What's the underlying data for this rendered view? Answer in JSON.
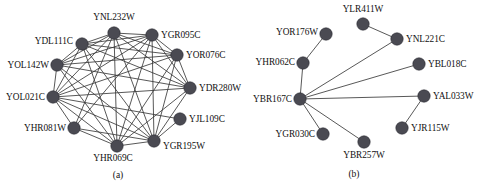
{
  "figure": {
    "width": 477,
    "height": 191,
    "node_color": "#4a4a52",
    "edge_color": "#3a3a3a",
    "background_color": "#ffffff"
  },
  "panels": [
    {
      "id": "a",
      "caption": "(a)",
      "caption_x": 118,
      "caption_y": 170,
      "node_radius": 6.2,
      "nodes": [
        {
          "id": "YNL232W",
          "label": "YNL232W",
          "x": 114,
          "y": 33,
          "label_pos": "above",
          "lx": 114,
          "ly": 22
        },
        {
          "id": "YGR095C",
          "label": "YGR095C",
          "x": 152,
          "y": 35,
          "label_pos": "right",
          "lx": 161,
          "ly": 35
        },
        {
          "id": "YDL111C",
          "label": "YDL111C",
          "x": 82,
          "y": 44,
          "label_pos": "left",
          "lx": 73,
          "ly": 41
        },
        {
          "id": "YOR076C",
          "label": "YOR076C",
          "x": 177,
          "y": 55,
          "label_pos": "right",
          "lx": 186,
          "ly": 55
        },
        {
          "id": "YOL142W",
          "label": "YOL142W",
          "x": 57,
          "y": 65,
          "label_pos": "left",
          "lx": 49,
          "ly": 65
        },
        {
          "id": "YDR280W",
          "label": "YDR280W",
          "x": 190,
          "y": 88,
          "label_pos": "right",
          "lx": 199,
          "ly": 88
        },
        {
          "id": "YOL021C",
          "label": "YOL021C",
          "x": 53,
          "y": 97,
          "label_pos": "left",
          "lx": 45,
          "ly": 97
        },
        {
          "id": "YJL109C",
          "label": "YJL109C",
          "x": 180,
          "y": 119,
          "label_pos": "right",
          "lx": 189,
          "ly": 119
        },
        {
          "id": "YHR081W",
          "label": "YHR081W",
          "x": 74,
          "y": 128,
          "label_pos": "left",
          "lx": 66,
          "ly": 128
        },
        {
          "id": "YGR195W",
          "label": "YGR195W",
          "x": 154,
          "y": 141,
          "label_pos": "right",
          "lx": 163,
          "ly": 146
        },
        {
          "id": "YHR069C",
          "label": "YHR069C",
          "x": 117,
          "y": 146,
          "label_pos": "below",
          "lx": 113,
          "ly": 153
        }
      ],
      "edges": [
        [
          "YNL232W",
          "YGR095C"
        ],
        [
          "YNL232W",
          "YDL111C"
        ],
        [
          "YNL232W",
          "YOR076C"
        ],
        [
          "YNL232W",
          "YOL142W"
        ],
        [
          "YNL232W",
          "YDR280W"
        ],
        [
          "YNL232W",
          "YOL021C"
        ],
        [
          "YNL232W",
          "YHR081W"
        ],
        [
          "YNL232W",
          "YGR195W"
        ],
        [
          "YNL232W",
          "YHR069C"
        ],
        [
          "YGR095C",
          "YDL111C"
        ],
        [
          "YGR095C",
          "YOR076C"
        ],
        [
          "YGR095C",
          "YOL142W"
        ],
        [
          "YGR095C",
          "YDR280W"
        ],
        [
          "YGR095C",
          "YOL021C"
        ],
        [
          "YGR095C",
          "YHR081W"
        ],
        [
          "YGR095C",
          "YGR195W"
        ],
        [
          "YGR095C",
          "YHR069C"
        ],
        [
          "YDL111C",
          "YOR076C"
        ],
        [
          "YDL111C",
          "YOL142W"
        ],
        [
          "YDL111C",
          "YDR280W"
        ],
        [
          "YDL111C",
          "YOL021C"
        ],
        [
          "YDL111C",
          "YGR195W"
        ],
        [
          "YDL111C",
          "YHR069C"
        ],
        [
          "YOR076C",
          "YOL142W"
        ],
        [
          "YOR076C",
          "YDR280W"
        ],
        [
          "YOR076C",
          "YOL021C"
        ],
        [
          "YOR076C",
          "YGR195W"
        ],
        [
          "YOR076C",
          "YHR069C"
        ],
        [
          "YOL142W",
          "YDR280W"
        ],
        [
          "YOL142W",
          "YOL021C"
        ],
        [
          "YOL142W",
          "YGR195W"
        ],
        [
          "YOL142W",
          "YHR069C"
        ],
        [
          "YDR280W",
          "YOL021C"
        ],
        [
          "YDR280W",
          "YGR195W"
        ],
        [
          "YDR280W",
          "YHR069C"
        ],
        [
          "YOL021C",
          "YHR081W"
        ],
        [
          "YOL021C",
          "YGR195W"
        ],
        [
          "YOL021C",
          "YHR069C"
        ],
        [
          "YOL021C",
          "YJL109C"
        ],
        [
          "YHR081W",
          "YHR069C"
        ],
        [
          "YHR081W",
          "YGR195W"
        ],
        [
          "YGR195W",
          "YHR069C"
        ],
        [
          "YJL109C",
          "YGR195W"
        ]
      ]
    },
    {
      "id": "b",
      "caption": "(b)",
      "caption_x": 354,
      "caption_y": 169,
      "node_radius": 6.2,
      "nodes": [
        {
          "id": "YLR411W",
          "label": "YLR411W",
          "x": 363,
          "y": 24,
          "label_pos": "above",
          "lx": 363,
          "ly": 14
        },
        {
          "id": "YOR176W",
          "label": "YOR176W",
          "x": 326,
          "y": 34,
          "label_pos": "left",
          "lx": 318,
          "ly": 32
        },
        {
          "id": "YNL221C",
          "label": "YNL221C",
          "x": 397,
          "y": 39,
          "label_pos": "right",
          "lx": 406,
          "ly": 39
        },
        {
          "id": "YHR062C",
          "label": "YHR062C",
          "x": 303,
          "y": 63,
          "label_pos": "left",
          "lx": 295,
          "ly": 62
        },
        {
          "id": "YBL018C",
          "label": "YBL018C",
          "x": 419,
          "y": 64,
          "label_pos": "right",
          "lx": 428,
          "ly": 64
        },
        {
          "id": "YBR167C",
          "label": "YBR167C",
          "x": 300,
          "y": 99,
          "label_pos": "left",
          "lx": 292,
          "ly": 99
        },
        {
          "id": "YAL033W",
          "label": "YAL033W",
          "x": 424,
          "y": 96,
          "label_pos": "right",
          "lx": 433,
          "ly": 96
        },
        {
          "id": "YGR030C",
          "label": "YGR030C",
          "x": 323,
          "y": 134,
          "label_pos": "left",
          "lx": 315,
          "ly": 134
        },
        {
          "id": "YJR115W",
          "label": "YJR115W",
          "x": 402,
          "y": 128,
          "label_pos": "right",
          "lx": 411,
          "ly": 128
        },
        {
          "id": "YBR257W",
          "label": "YBR257W",
          "x": 364,
          "y": 142,
          "label_pos": "below",
          "lx": 364,
          "ly": 150
        }
      ],
      "edges": [
        [
          "YBR167C",
          "YHR062C"
        ],
        [
          "YBR167C",
          "YNL221C"
        ],
        [
          "YBR167C",
          "YBL018C"
        ],
        [
          "YBR167C",
          "YAL033W"
        ],
        [
          "YBR167C",
          "YGR030C"
        ],
        [
          "YBR167C",
          "YBR257W"
        ],
        [
          "YHR062C",
          "YOR176W"
        ],
        [
          "YNL221C",
          "YLR411W"
        ],
        [
          "YAL033W",
          "YJR115W"
        ]
      ]
    }
  ]
}
